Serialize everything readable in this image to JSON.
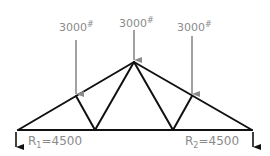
{
  "diagram": {
    "type": "truss",
    "loads": [
      {
        "value": "3000",
        "unit": "#"
      },
      {
        "value": "3000",
        "unit": "#"
      },
      {
        "value": "3000",
        "unit": "#"
      }
    ],
    "reactions": [
      {
        "symbol": "R",
        "sub": "1",
        "value": "=4500"
      },
      {
        "symbol": "R",
        "sub": "2",
        "value": "=4500"
      }
    ],
    "colors": {
      "member": "#111111",
      "load": "#8a8a8a",
      "text": "#8a8a8a"
    }
  }
}
